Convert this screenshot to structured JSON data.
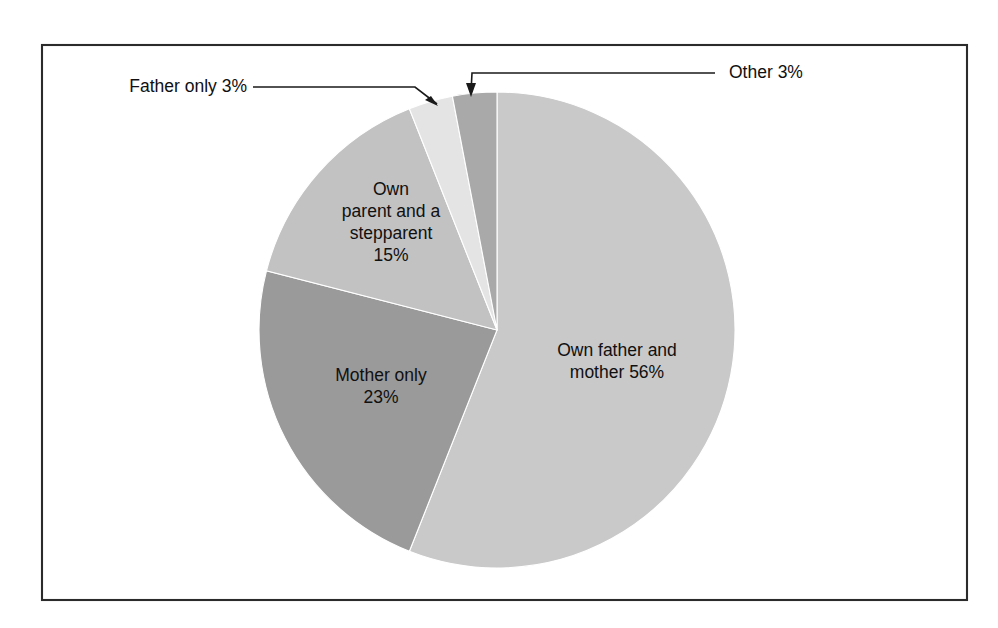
{
  "figure": {
    "background_color": "#ffffff",
    "frame": {
      "name": "chart-border",
      "x": 42,
      "y": 45,
      "width": 925,
      "height": 555,
      "stroke_color": "#2b2b2b"
    }
  },
  "chart_data": {
    "type": "pie",
    "title": "",
    "subtitle": "",
    "xlabel": "",
    "ylabel": "",
    "grid": false,
    "legend_position": "none",
    "start_angle_deg": 0,
    "direction": "clockwise",
    "center": {
      "x": 497,
      "y": 330
    },
    "radius": 238,
    "units": "percent",
    "total": 100,
    "categories": [
      "Own father and mother",
      "Mother only",
      "Own parent and a stepparent",
      "Father only",
      "Other"
    ],
    "values": [
      56,
      23,
      15,
      3,
      3
    ],
    "slices": [
      {
        "name": "own-father-and-mother",
        "category": "Own father and mother",
        "value": 56,
        "value_text": "56%",
        "color": "#c9c9c9",
        "label_placement": "inside",
        "label_lines": [
          "Own father and",
          "mother 56%"
        ],
        "label_x": 617,
        "label_y": 362
      },
      {
        "name": "mother-only",
        "category": "Mother only",
        "value": 23,
        "value_text": "23%",
        "color": "#9a9a9a",
        "label_placement": "inside",
        "label_lines": [
          "Mother only",
          "23%"
        ],
        "label_x": 381,
        "label_y": 387
      },
      {
        "name": "own-parent-and-a-stepparent",
        "category": "Own parent and a stepparent",
        "value": 15,
        "value_text": "15%",
        "color": "#c2c2c2",
        "label_placement": "inside",
        "label_lines": [
          "Own",
          "parent and a",
          "stepparent",
          "15%"
        ],
        "label_x": 391,
        "label_y": 223
      },
      {
        "name": "father-only",
        "category": "Father only",
        "value": 3,
        "value_text": "3%",
        "color": "#e4e4e4",
        "label_placement": "callout-left",
        "label_text": "Father only 3%",
        "label_x": 247,
        "label_y": 87,
        "leader_points": "253,87 415,87 437,104",
        "arrow_points": "438,106 425,100 431,96"
      },
      {
        "name": "other",
        "category": "Other",
        "value": 3,
        "value_text": "3%",
        "color": "#a9a9a9",
        "label_placement": "callout-right",
        "label_text": "Other 3%",
        "label_x": 729,
        "label_y": 73,
        "leader_points": "715,73 472,73 471,92",
        "arrow_points": "471,97 466,83 476,83"
      }
    ]
  }
}
